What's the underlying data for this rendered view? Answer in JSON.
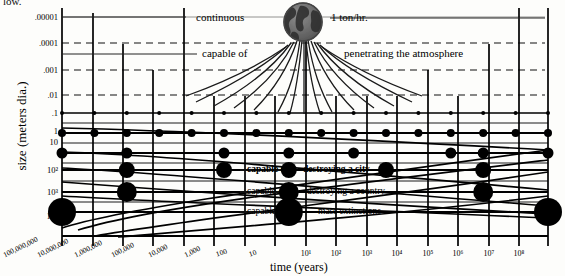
{
  "figure": {
    "cut_off_top_text": "low.",
    "x_axis_title": "time (years)",
    "y_axis_title": "size (meters dia.)"
  },
  "annotations": {
    "continuous": "continuous",
    "one_ton_per_hour": "1 ton/hr.",
    "capable_of_penetrating_prefix": "capable of",
    "penetrating_atmosphere": "penetrating the atmosphere",
    "capable_of_city_prefix": "capable of",
    "destroying_a_city": "destroying a city",
    "capable_of_country_prefix": "capable of",
    "destroying_a_country": "destroying a country",
    "capable_of_extinctions_prefix": "capable of",
    "mass_extinctions": "mass extinctions",
    "earth_icon": "earth-globe-icon"
  },
  "chart_data": {
    "type": "scatter",
    "title": "",
    "xlabel": "time (years)",
    "ylabel": "size (meters dia.)",
    "grid": true,
    "legend_position": "none",
    "x_tick_labels": [
      "100,000,000",
      "10,000,000",
      "1,000,000",
      "100,000",
      "10,000",
      "1,000",
      "100",
      "10",
      "10¹",
      "10²",
      "10³",
      "10⁴",
      "10⁵",
      "10⁶",
      "10⁷",
      "10⁸"
    ],
    "x_tick_exponents": [
      -8,
      -7,
      -6,
      -5,
      -4,
      -3,
      -2,
      -1,
      1,
      2,
      3,
      4,
      5,
      6,
      7,
      8
    ],
    "y_tick_labels": [
      ".00001",
      ".0001",
      ".001",
      ".01",
      ".1",
      "1",
      "10",
      "10²",
      "10³",
      "10⁴"
    ],
    "y_tick_exponents": [
      -5,
      -4,
      -3,
      -2,
      -1,
      0,
      1,
      2,
      3,
      4
    ],
    "xlim": [
      -8.6,
      8.6
    ],
    "ylim": [
      -5.4,
      4.6
    ],
    "y_axis_direction": "inverted",
    "dotted_rows": [
      {
        "size_label": ".1",
        "y_exp": -1,
        "dot_radius": 2.0,
        "x_exps": [
          -8,
          -7,
          -6,
          -5,
          -4,
          -3,
          -2,
          -1,
          1,
          2,
          3,
          4,
          5,
          6,
          7,
          8
        ]
      },
      {
        "size_label": "1",
        "y_exp": 0,
        "dot_radius": 4.0,
        "x_exps": [
          -8,
          -7,
          -6,
          -5,
          -4,
          -3,
          -2,
          -1,
          1,
          2,
          3,
          4,
          5,
          6,
          7,
          8
        ]
      },
      {
        "size_label": "10",
        "y_exp": 1,
        "dot_radius": 5.5,
        "x_exps": [
          -8,
          -6,
          -3,
          -1,
          2,
          5,
          6,
          8
        ]
      },
      {
        "size_label": "10²",
        "y_exp": 2,
        "dot_radius": 8.0,
        "x_exps": [
          -6,
          -3,
          -1,
          3,
          6
        ]
      },
      {
        "size_label": "10³",
        "y_exp": 3,
        "dot_radius": 10.0,
        "x_exps": [
          -6,
          -1,
          6
        ]
      },
      {
        "size_label": "10⁴",
        "y_exp": 4,
        "dot_radius": 14.0,
        "x_exps": [
          -8,
          -1,
          8
        ]
      }
    ],
    "dashed_hlines_y_exp": [
      -4,
      -3,
      -2
    ],
    "thin_hline_y_exp": -5,
    "curve_count": 6,
    "curve_description": "hyperbolic frequency curves sweeping from upper-left to lower-right"
  }
}
